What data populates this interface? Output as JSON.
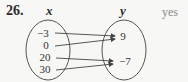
{
  "problem": {
    "number": "26.",
    "answer": "yes"
  },
  "diagram": {
    "type": "mapping",
    "domain_label": "x",
    "range_label": "y",
    "domain": [
      "−3",
      "0",
      "20",
      "30"
    ],
    "range": [
      "9",
      "−7"
    ],
    "mappings": [
      {
        "from": "−3",
        "to": "9"
      },
      {
        "from": "0",
        "to": "9"
      },
      {
        "from": "20",
        "to": "−7"
      },
      {
        "from": "30",
        "to": "−7"
      }
    ]
  }
}
